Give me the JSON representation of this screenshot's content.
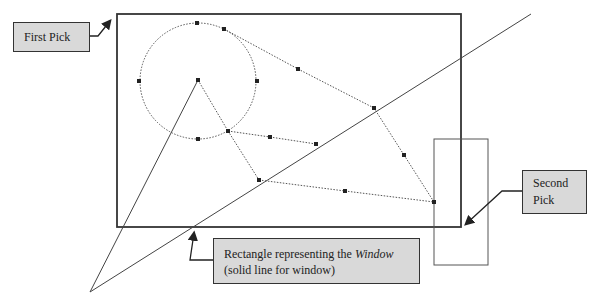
{
  "callouts": {
    "first_pick": "First Pick",
    "second_pick_line1": "Second",
    "second_pick_line2": "Pick",
    "window_line1_prefix": "Rectangle representing the ",
    "window_line1_italic": "Window",
    "window_line2": "(solid line for window)"
  },
  "geometry": {
    "window_rect": {
      "x": 117,
      "y": 14,
      "w": 344,
      "h": 213
    },
    "second_pick_rect": {
      "x": 434,
      "y": 139,
      "w": 54,
      "h": 126
    },
    "circle": {
      "cx": 198,
      "cy": 81,
      "r": 58
    },
    "long_line": {
      "x1": 90,
      "y1": 292,
      "x2": 531,
      "y2": 14
    },
    "center_line": {
      "x1": 90,
      "y1": 292,
      "x2": 198,
      "y2": 80
    }
  },
  "colors": {
    "callout_fill": "#d9d9d9",
    "line": "#333333",
    "dotted": "#555555"
  }
}
